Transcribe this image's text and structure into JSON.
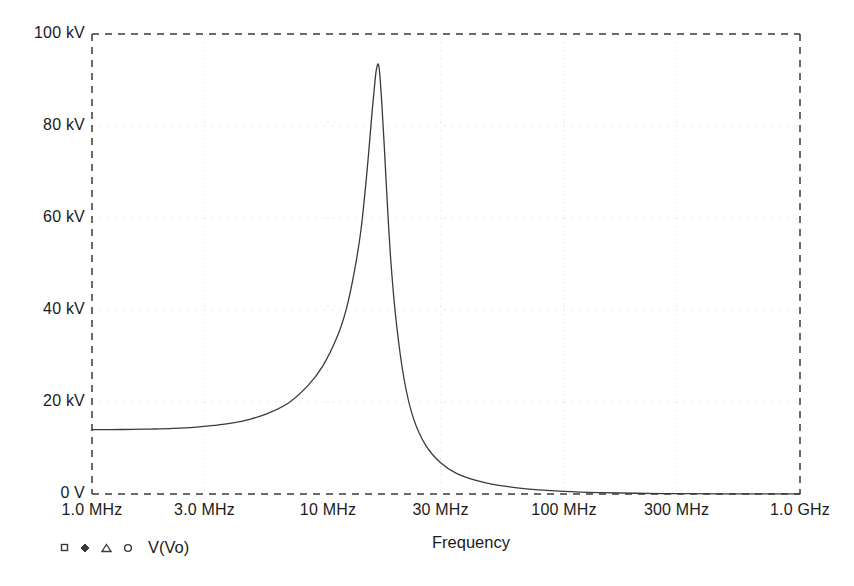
{
  "chart_data": {
    "type": "line",
    "title": "",
    "xlabel": "Frequency",
    "ylabel": "",
    "xscale": "log",
    "xlim": [
      1000000,
      1000000000
    ],
    "ylim": [
      0,
      100000
    ],
    "grid": true,
    "grid_style": "dotted",
    "frame_style": "dashed",
    "legend": {
      "position": "bottom-left",
      "entries": [
        {
          "label": "V(Vo)",
          "markers": [
            "square-marker",
            "diamond-marker",
            "triangle-marker",
            "circle-marker"
          ],
          "color": "#3a3a3a"
        }
      ]
    },
    "xticks": [
      {
        "value": 1000000,
        "label": "1.0 MHz"
      },
      {
        "value": 3000000,
        "label": "3.0 MHz"
      },
      {
        "value": 10000000,
        "label": "10 MHz"
      },
      {
        "value": 30000000,
        "label": "30 MHz"
      },
      {
        "value": 100000000,
        "label": "100 MHz"
      },
      {
        "value": 300000000,
        "label": "300 MHz"
      },
      {
        "value": 1000000000,
        "label": "1.0 GHz"
      }
    ],
    "yticks": [
      {
        "value": 0,
        "label": "0 V"
      },
      {
        "value": 20000,
        "label": "20 kV"
      },
      {
        "value": 40000,
        "label": "40 kV"
      },
      {
        "value": 60000,
        "label": "60 kV"
      },
      {
        "value": 80000,
        "label": "80 kV"
      },
      {
        "value": 100000,
        "label": "100 kV"
      }
    ],
    "series": [
      {
        "name": "V(Vo)",
        "color": "#3a3a3a",
        "peak": {
          "frequency": 16300000,
          "value": 93500,
          "label": "93.5 kV"
        },
        "baseline_value": 14000,
        "x": [
          1000000,
          1200000,
          1500000,
          1800000,
          2200000,
          2700000,
          3300000,
          3900000,
          4700000,
          5600000,
          6800000,
          8200000,
          9500000,
          11000000,
          12000000,
          13000000,
          13800000,
          14500000,
          15000000,
          15400000,
          15700000,
          15950000,
          16150000,
          16300000,
          16450000,
          16650000,
          16900000,
          17300000,
          17800000,
          18500000,
          19500000,
          21000000,
          23000000,
          26000000,
          30000000,
          35000000,
          42000000,
          50000000,
          62000000,
          78000000,
          100000000,
          140000000,
          200000000,
          300000000,
          450000000,
          650000000,
          1000000000
        ],
        "y": [
          14000,
          14000,
          14050,
          14120,
          14250,
          14480,
          14900,
          15400,
          16300,
          17600,
          19800,
          23500,
          27800,
          34500,
          40500,
          49000,
          57500,
          68000,
          76500,
          83500,
          88000,
          91500,
          93000,
          93500,
          92800,
          90000,
          85000,
          76000,
          64000,
          50000,
          37000,
          25000,
          16500,
          10500,
          6800,
          4500,
          3000,
          2100,
          1400,
          900,
          560,
          300,
          160,
          80,
          40,
          20,
          8
        ]
      }
    ]
  },
  "geometry": {
    "plot_left": 92,
    "plot_right": 800,
    "plot_top": 34,
    "plot_bottom": 494
  },
  "colors": {
    "frame": "#3a3a3a",
    "grid": "#cfcfcf",
    "curve": "#3a3a3a",
    "text": "#1b1b1b",
    "background": "#ffffff"
  },
  "axis_title": "Frequency",
  "legend_label": "V(Vo)"
}
